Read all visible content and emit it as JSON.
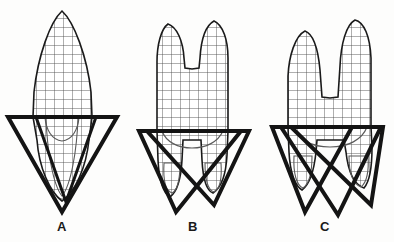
{
  "figure": {
    "background_color": "#fdfdfc",
    "ink_color": "#141414",
    "grid_color": "#4a4a4a",
    "outline_color": "#1a1a1a",
    "grid_spacing_px": 9,
    "panels": [
      {
        "id": "A",
        "label": "A",
        "label_x": 50,
        "label_y": 219,
        "tooth_type": "single-cusp single-root",
        "cusp_count": 1,
        "root_count": 1,
        "triangle_count": 2,
        "crown": {
          "apex": [
            62,
            11
          ],
          "left_edge_x": 33,
          "right_edge_x": 92,
          "cervix_y": 117
        },
        "triangles": [
          {
            "name": "outer-triangle",
            "points": "8,117 117,117 62,212",
            "stroke_width": 4
          },
          {
            "name": "inner-triangle",
            "points": "36,117 96,117 66,202",
            "stroke_width": 3
          }
        ],
        "root_outline": {
          "apex": [
            62,
            200
          ],
          "left_x": 37,
          "right_x": 90
        }
      },
      {
        "id": "B",
        "label": "B",
        "label_x": 181,
        "label_y": 219,
        "tooth_type": "two-cusp two-root",
        "cusp_count": 2,
        "root_count": 2,
        "triangle_count": 2,
        "crown": {
          "cusp_left_apex": [
            168,
            24
          ],
          "cusp_right_apex": [
            214,
            21
          ],
          "notch": [
            192,
            68
          ],
          "left_edge_x": 157,
          "right_edge_x": 228,
          "cervix_y": 131
        },
        "triangles": [
          {
            "name": "left-triangle",
            "points": "139,131 241,131 176,212",
            "stroke_width": 4
          },
          {
            "name": "right-triangle",
            "points": "147,131 249,131 214,205",
            "stroke_width": 4
          }
        ],
        "root_outline": {
          "left_root_apex": [
            170,
            196
          ],
          "right_root_apex": [
            213,
            192
          ]
        }
      },
      {
        "id": "C",
        "label": "C",
        "label_x": 313,
        "label_y": 219,
        "tooth_type": "multi-cusp three-root",
        "cusp_count": 2,
        "root_count": 3,
        "triangle_count": 3,
        "crown": {
          "cusp_left_apex": [
            305,
            31
          ],
          "cusp_right_apex": [
            355,
            20
          ],
          "notch": [
            330,
            97
          ],
          "left_edge_x": 288,
          "right_edge_x": 371,
          "cervix_y": 127
        },
        "triangles": [
          {
            "name": "left-triangle",
            "points": "272,127 352,127 305,212",
            "stroke_width": 4
          },
          {
            "name": "middle-triangle",
            "points": "281,127 381,127 338,215",
            "stroke_width": 4
          },
          {
            "name": "right-triangle",
            "points": "291,127 383,127 371,205",
            "stroke_width": 4
          }
        ],
        "root_outline": {
          "left_root_apex": [
            302,
            190
          ],
          "mid_root_apex": [
            335,
            192
          ],
          "right_root_apex": [
            364,
            188
          ]
        }
      }
    ]
  }
}
